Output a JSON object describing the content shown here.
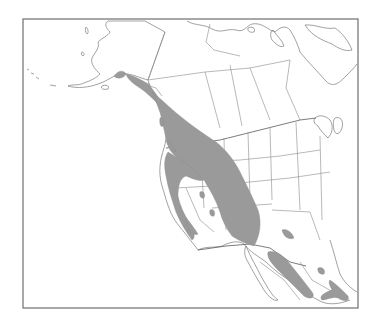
{
  "map": {
    "type": "species-range-map",
    "region": "Western North America",
    "frame": {
      "x": 23,
      "y": 19,
      "width": 335,
      "height": 289
    },
    "colors": {
      "background": "#ffffff",
      "range_fill": "#9a9a9a",
      "border": "#8a8a8a",
      "frame": "#6e6e6e"
    },
    "layers": [
      "coastlines",
      "political-borders",
      "range-shading"
    ],
    "range_regions": [
      "southeast-alaska-coast",
      "pacific-northwest-rockies",
      "sierra-nevada",
      "southern-rockies",
      "great-basin-islands",
      "sierra-madre-occidental",
      "sierra-madre-oriental"
    ]
  }
}
